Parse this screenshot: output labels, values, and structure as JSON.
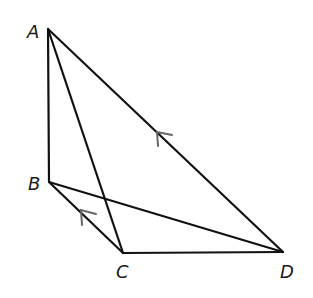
{
  "diagram": {
    "type": "geometry",
    "points": {
      "A": {
        "label": "A",
        "x": 48,
        "y": 29,
        "label_x": 27,
        "label_y": 38
      },
      "B": {
        "label": "B",
        "x": 49,
        "y": 182,
        "label_x": 28,
        "label_y": 190
      },
      "C": {
        "label": "C",
        "x": 123,
        "y": 253,
        "label_x": 116,
        "label_y": 278
      },
      "D": {
        "label": "D",
        "x": 283,
        "y": 252,
        "label_x": 280,
        "label_y": 278
      }
    },
    "segments": [
      "AB",
      "AC",
      "AD",
      "BC",
      "BD",
      "CD"
    ],
    "parallel_marks": [
      {
        "segment": "AD",
        "direction": "toward A"
      },
      {
        "segment": "BC",
        "direction": "toward B"
      }
    ],
    "colors": {
      "line": "#111111",
      "arrow": "#666666"
    }
  }
}
